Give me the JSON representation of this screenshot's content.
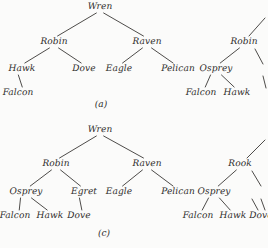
{
  "figure": {
    "background_color": "#fbfbfa",
    "ink_color": "#2e2c2b",
    "style": "scanned textbook figure of labelled trees"
  },
  "panels": [
    {
      "caption": "(a)",
      "caption_x": 101,
      "caption_y": 104,
      "trees": [
        {
          "name": "tree-a-main",
          "nodes": [
            {
              "label": "Wren",
              "x": 100,
              "y": 7
            },
            {
              "label": "Robin",
              "x": 54,
              "y": 42
            },
            {
              "label": "Raven",
              "x": 147,
              "y": 42
            },
            {
              "label": "Hawk",
              "x": 22,
              "y": 69
            },
            {
              "label": "Dove",
              "x": 84,
              "y": 69
            },
            {
              "label": "Eagle",
              "x": 119,
              "y": 69
            },
            {
              "label": "Pelican",
              "x": 178,
              "y": 69
            },
            {
              "label": "Falcon",
              "x": 18,
              "y": 93
            }
          ],
          "edges": [
            {
              "from": "Wren",
              "to": "Robin"
            },
            {
              "from": "Wren",
              "to": "Raven"
            },
            {
              "from": "Robin",
              "to": "Hawk"
            },
            {
              "from": "Robin",
              "to": "Dove"
            },
            {
              "from": "Raven",
              "to": "Eagle"
            },
            {
              "from": "Raven",
              "to": "Pelican"
            },
            {
              "from": "Hawk",
              "to": "Falcon"
            }
          ]
        },
        {
          "name": "tree-a-right-clipped",
          "clipped": true,
          "nodes": [
            {
              "label": "Robin",
              "x": 244,
              "y": 42
            },
            {
              "label": "Osprey",
              "x": 216,
              "y": 69
            },
            {
              "label": "Falcon",
              "x": 201,
              "y": 93
            },
            {
              "label": "Hawk",
              "x": 237,
              "y": 93
            }
          ],
          "edges": [
            {
              "from": "Robin",
              "to": "Osprey"
            },
            {
              "from": "Osprey",
              "to": "Falcon"
            },
            {
              "from": "Osprey",
              "to": "Hawk"
            }
          ]
        }
      ]
    },
    {
      "caption": "(c)",
      "caption_x": 104,
      "caption_y": 233,
      "trees": [
        {
          "name": "tree-c-main",
          "nodes": [
            {
              "label": "Wren",
              "x": 100,
              "y": 130
            },
            {
              "label": "Robin",
              "x": 56,
              "y": 164
            },
            {
              "label": "Raven",
              "x": 147,
              "y": 164
            },
            {
              "label": "Osprey",
              "x": 26,
              "y": 192
            },
            {
              "label": "Egret",
              "x": 84,
              "y": 192
            },
            {
              "label": "Eagle",
              "x": 119,
              "y": 192
            },
            {
              "label": "Pelican",
              "x": 178,
              "y": 192
            },
            {
              "label": "Falcon",
              "x": 15,
              "y": 216
            },
            {
              "label": "Hawk",
              "x": 50,
              "y": 216
            },
            {
              "label": "Dove",
              "x": 79,
              "y": 216
            }
          ],
          "edges": [
            {
              "from": "Wren",
              "to": "Robin"
            },
            {
              "from": "Wren",
              "to": "Raven"
            },
            {
              "from": "Robin",
              "to": "Osprey"
            },
            {
              "from": "Robin",
              "to": "Egret"
            },
            {
              "from": "Raven",
              "to": "Eagle"
            },
            {
              "from": "Raven",
              "to": "Pelican"
            },
            {
              "from": "Osprey",
              "to": "Falcon"
            },
            {
              "from": "Osprey",
              "to": "Hawk"
            },
            {
              "from": "Egret",
              "to": "Dove"
            }
          ]
        },
        {
          "name": "tree-c-right-clipped",
          "clipped": true,
          "nodes": [
            {
              "label": "Rook",
              "x": 240,
              "y": 164
            },
            {
              "label": "Osprey",
              "x": 214,
              "y": 192
            },
            {
              "label": "Falcon",
              "x": 198,
              "y": 216
            },
            {
              "label": "Hawk",
              "x": 233,
              "y": 216
            },
            {
              "label": "Dove",
              "x": 261,
              "y": 216
            }
          ],
          "edges": [
            {
              "from": "Rook",
              "to": "Osprey"
            },
            {
              "from": "Osprey",
              "to": "Falcon"
            },
            {
              "from": "Osprey",
              "to": "Hawk"
            }
          ]
        }
      ]
    }
  ],
  "stubs": [
    {
      "name": "stub-a-parent",
      "x1": 249,
      "y1": 36,
      "x2": 265,
      "y2": 18
    },
    {
      "name": "stub-a-right-child",
      "x1": 255,
      "y1": 49,
      "x2": 263,
      "y2": 64
    },
    {
      "name": "stub-a-right-leaf",
      "x1": 263,
      "y1": 76,
      "x2": 266,
      "y2": 88
    },
    {
      "name": "stub-c-parent",
      "x1": 247,
      "y1": 158,
      "x2": 265,
      "y2": 140
    },
    {
      "name": "stub-c-right-child",
      "x1": 252,
      "y1": 171,
      "x2": 261,
      "y2": 186
    },
    {
      "name": "stub-c-right-leaf",
      "x1": 261,
      "y1": 199,
      "x2": 265,
      "y2": 210
    },
    {
      "name": "stub-c-dove-edge",
      "x1": 252,
      "y1": 199,
      "x2": 258,
      "y2": 210
    }
  ]
}
